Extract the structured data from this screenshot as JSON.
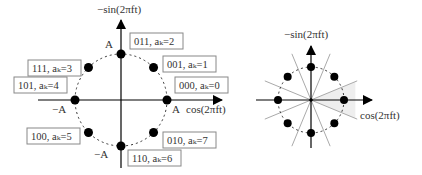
{
  "left_diagram": {
    "title": "8-PSK constellation with Gray-coded symbol labels",
    "y_axis_label": "−sin(2πft)",
    "x_axis_label": "cos(2πft)",
    "amplitude_labels": {
      "top": "A",
      "bottom": "−A",
      "left": "−A",
      "right": "A"
    },
    "points": [
      {
        "bits": "000",
        "k": 0,
        "label": "000, aₖ=0"
      },
      {
        "bits": "001",
        "k": 1,
        "label": "001, aₖ=1"
      },
      {
        "bits": "011",
        "k": 2,
        "label": "011, aₖ=2"
      },
      {
        "bits": "111",
        "k": 3,
        "label": "111, aₖ=3"
      },
      {
        "bits": "101",
        "k": 4,
        "label": "101, aₖ=4"
      },
      {
        "bits": "100",
        "k": 5,
        "label": "100, aₖ=5"
      },
      {
        "bits": "110",
        "k": 6,
        "label": "110, aₖ=6"
      },
      {
        "bits": "010",
        "k": 7,
        "label": "010, aₖ=7"
      }
    ]
  },
  "right_diagram": {
    "title": "8-PSK decision regions",
    "y_axis_label": "−sin(2πft)",
    "x_axis_label": "cos(2πft)",
    "num_points": 8,
    "boundary_angles_deg": [
      22.5,
      67.5,
      112.5,
      157.5
    ],
    "shaded_region": "aₖ=0 decision sector"
  },
  "colors": {
    "axis": "#000000",
    "point": "#000000",
    "boundary": "#aaaaaa",
    "shade": "#eeeeee",
    "box_border": "#888888"
  }
}
